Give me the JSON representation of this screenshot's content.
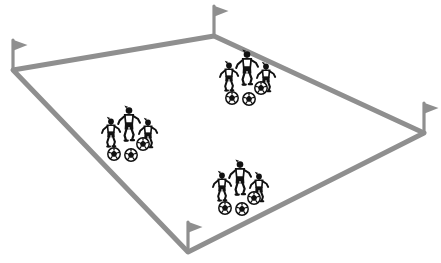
{
  "scene": {
    "title": "Soccer field perspective diagram with player groups",
    "background_color": "#ffffff",
    "width": 441,
    "height": 263
  },
  "field": {
    "name": "soccer-field-outline",
    "shape": "quadrilateral-perspective",
    "line_color": "#8f8f8f",
    "line_width": 5,
    "fill_color": "#ffffff",
    "corners": {
      "top": {
        "x": 214,
        "y": 36
      },
      "right": {
        "x": 424,
        "y": 133
      },
      "bottom": {
        "x": 188,
        "y": 252
      },
      "left": {
        "x": 13,
        "y": 70
      }
    },
    "edges": [
      {
        "name": "left-to-top",
        "from": "left",
        "to": "top"
      },
      {
        "name": "top-to-right",
        "from": "top",
        "to": "right"
      },
      {
        "name": "right-to-bottom",
        "from": "right",
        "to": "bottom"
      },
      {
        "name": "bottom-to-left",
        "from": "bottom",
        "to": "left"
      }
    ]
  },
  "corner_flags": [
    {
      "name": "corner-flag-left",
      "x": 13,
      "y": 70,
      "pole_height": 30,
      "flag_direction": "right",
      "color": "#8f8f8f"
    },
    {
      "name": "corner-flag-top",
      "x": 214,
      "y": 36,
      "pole_height": 30,
      "flag_direction": "right",
      "color": "#8f8f8f"
    },
    {
      "name": "corner-flag-right",
      "x": 424,
      "y": 133,
      "pole_height": 30,
      "flag_direction": "right",
      "color": "#8f8f8f"
    },
    {
      "name": "corner-flag-bottom",
      "x": 188,
      "y": 252,
      "pole_height": 30,
      "flag_direction": "right",
      "color": "#8f8f8f"
    }
  ],
  "player_groups": [
    {
      "name": "player-group-top",
      "id": 1,
      "x": 247,
      "y": 72,
      "player_count": 3,
      "ball_count": 3,
      "color": "#111111"
    },
    {
      "name": "player-group-left",
      "id": 2,
      "x": 129,
      "y": 128,
      "player_count": 3,
      "ball_count": 3,
      "color": "#111111"
    },
    {
      "name": "player-group-bottom",
      "id": 3,
      "x": 240,
      "y": 182,
      "player_count": 3,
      "ball_count": 3,
      "color": "#111111"
    }
  ],
  "totals": {
    "players": 9,
    "balls": 9,
    "groups": 3,
    "flags": 4
  }
}
